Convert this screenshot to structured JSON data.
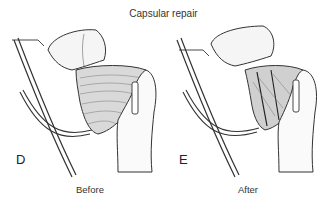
{
  "figure": {
    "title": "Capsular repair",
    "panels": [
      {
        "letter": "D",
        "caption": "Before"
      },
      {
        "letter": "E",
        "caption": "After"
      }
    ]
  }
}
